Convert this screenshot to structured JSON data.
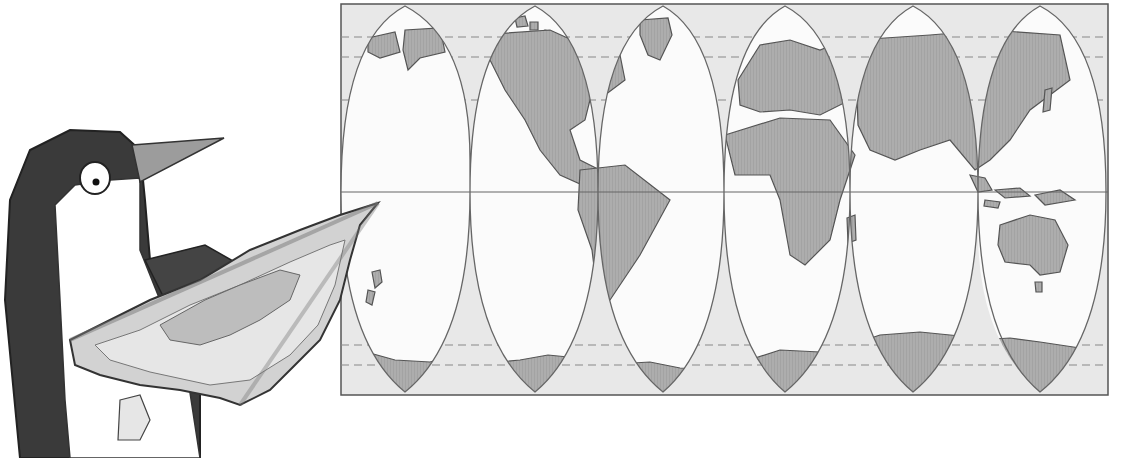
{
  "illustration": {
    "subject": "penguin holding a map next to an interrupted world map projection",
    "map": {
      "projection": "interrupted (orange-peel) gores",
      "gore_count": 6,
      "frame": {
        "x": 341,
        "y": 4,
        "width": 767,
        "height": 391
      },
      "equator_y": 192,
      "gore_centers_x": [
        405,
        535,
        663,
        785,
        913,
        1040
      ],
      "landmasses": [
        "North America",
        "South America",
        "Greenland",
        "Europe",
        "Africa",
        "Asia",
        "Australia",
        "Antarctica",
        "New Zealand",
        "Madagascar"
      ]
    },
    "colors": {
      "background": "#ffffff",
      "ocean_outside_gores": "#e6e6e6",
      "ocean_inside_gores": "#fafafa",
      "land": "#a9a9a9",
      "outline": "#555555",
      "penguin_dark": "#3a3a3a",
      "penguin_light": "#ffffff",
      "beak": "#9c9c9c",
      "held_map": "#d0d0d0"
    }
  }
}
